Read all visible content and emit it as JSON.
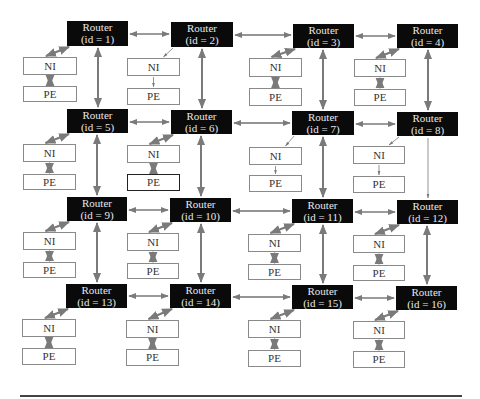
{
  "diagram": {
    "type": "2D mesh Network-on-Chip (4x4)",
    "router_label": "Router",
    "ni_label": "NI",
    "pe_label": "PE",
    "routers": [
      {
        "id": 1,
        "label": "Router",
        "sub": "(id = 1)",
        "x": 67,
        "y": 21,
        "w": 61,
        "h": 25
      },
      {
        "id": 2,
        "label": "Router",
        "sub": "(id = 2)",
        "x": 171,
        "y": 22,
        "w": 62,
        "h": 25
      },
      {
        "id": 3,
        "label": "Router",
        "sub": "(id = 3)",
        "x": 293,
        "y": 24,
        "w": 61,
        "h": 24
      },
      {
        "id": 4,
        "label": "Router",
        "sub": "(id = 4)",
        "x": 397,
        "y": 24,
        "w": 61,
        "h": 24
      },
      {
        "id": 5,
        "label": "Router",
        "sub": "(id = 5)",
        "x": 67,
        "y": 109,
        "w": 61,
        "h": 24
      },
      {
        "id": 6,
        "label": "Router",
        "sub": "(id = 6)",
        "x": 171,
        "y": 110,
        "w": 61,
        "h": 24
      },
      {
        "id": 7,
        "label": "Router",
        "sub": "(id = 7)",
        "x": 292,
        "y": 111,
        "w": 62,
        "h": 24
      },
      {
        "id": 8,
        "label": "Router",
        "sub": "(id = 8)",
        "x": 397,
        "y": 112,
        "w": 61,
        "h": 24
      },
      {
        "id": 9,
        "label": "Router",
        "sub": "(id = 9)",
        "x": 67,
        "y": 197,
        "w": 60,
        "h": 24
      },
      {
        "id": 10,
        "label": "Router",
        "sub": "(id = 10)",
        "x": 170,
        "y": 198,
        "w": 61,
        "h": 24
      },
      {
        "id": 11,
        "label": "Router",
        "sub": "(id = 11)",
        "x": 292,
        "y": 199,
        "w": 61,
        "h": 24
      },
      {
        "id": 12,
        "label": "Router",
        "sub": "(id = 12)",
        "x": 397,
        "y": 200,
        "w": 61,
        "h": 24
      },
      {
        "id": 13,
        "label": "Router",
        "sub": "(id = 13)",
        "x": 66,
        "y": 284,
        "w": 61,
        "h": 24
      },
      {
        "id": 14,
        "label": "Router",
        "sub": "(id = 14)",
        "x": 170,
        "y": 284,
        "w": 61,
        "h": 24
      },
      {
        "id": 15,
        "label": "Router",
        "sub": "(id = 15)",
        "x": 292,
        "y": 285,
        "w": 61,
        "h": 24
      },
      {
        "id": 16,
        "label": "Router",
        "sub": "(id = 16)",
        "x": 396,
        "y": 286,
        "w": 61,
        "h": 24
      }
    ],
    "nodes": [
      {
        "router": 1,
        "ni": {
          "x": 23,
          "y": 57,
          "w": 54,
          "h": 18
        },
        "pe": {
          "x": 23,
          "y": 86,
          "w": 54,
          "h": 16
        },
        "pe_bold": false,
        "thin": false
      },
      {
        "router": 2,
        "ni": {
          "x": 127,
          "y": 58,
          "w": 53,
          "h": 18
        },
        "pe": {
          "x": 127,
          "y": 88,
          "w": 53,
          "h": 17
        },
        "pe_bold": false,
        "thin": true
      },
      {
        "router": 3,
        "ni": {
          "x": 249,
          "y": 58,
          "w": 53,
          "h": 19
        },
        "pe": {
          "x": 249,
          "y": 88,
          "w": 53,
          "h": 18
        },
        "pe_bold": false,
        "thin": false
      },
      {
        "router": 4,
        "ni": {
          "x": 354,
          "y": 59,
          "w": 52,
          "h": 18
        },
        "pe": {
          "x": 354,
          "y": 89,
          "w": 52,
          "h": 17
        },
        "pe_bold": false,
        "thin": false
      },
      {
        "router": 5,
        "ni": {
          "x": 23,
          "y": 144,
          "w": 53,
          "h": 18
        },
        "pe": {
          "x": 23,
          "y": 174,
          "w": 53,
          "h": 16
        },
        "pe_bold": false,
        "thin": false
      },
      {
        "router": 6,
        "ni": {
          "x": 127,
          "y": 145,
          "w": 53,
          "h": 18
        },
        "pe": {
          "x": 127,
          "y": 174,
          "w": 53,
          "h": 17
        },
        "pe_bold": true,
        "thin": false
      },
      {
        "router": 7,
        "ni": {
          "x": 249,
          "y": 147,
          "w": 53,
          "h": 18
        },
        "pe": {
          "x": 249,
          "y": 175,
          "w": 53,
          "h": 17
        },
        "pe_bold": false,
        "thin": true
      },
      {
        "router": 8,
        "ni": {
          "x": 353,
          "y": 146,
          "w": 52,
          "h": 18
        },
        "pe": {
          "x": 353,
          "y": 176,
          "w": 52,
          "h": 17
        },
        "pe_bold": false,
        "thin": true
      },
      {
        "router": 9,
        "ni": {
          "x": 23,
          "y": 232,
          "w": 53,
          "h": 18
        },
        "pe": {
          "x": 23,
          "y": 262,
          "w": 53,
          "h": 16
        },
        "pe_bold": false,
        "thin": false
      },
      {
        "router": 10,
        "ni": {
          "x": 127,
          "y": 233,
          "w": 52,
          "h": 18
        },
        "pe": {
          "x": 127,
          "y": 263,
          "w": 52,
          "h": 16
        },
        "pe_bold": false,
        "thin": false
      },
      {
        "router": 11,
        "ni": {
          "x": 248,
          "y": 234,
          "w": 53,
          "h": 18
        },
        "pe": {
          "x": 248,
          "y": 264,
          "w": 53,
          "h": 16
        },
        "pe_bold": false,
        "thin": false
      },
      {
        "router": 12,
        "ni": {
          "x": 353,
          "y": 235,
          "w": 52,
          "h": 18
        },
        "pe": {
          "x": 353,
          "y": 265,
          "w": 52,
          "h": 16
        },
        "pe_bold": false,
        "thin": false
      },
      {
        "router": 13,
        "ni": {
          "x": 22,
          "y": 319,
          "w": 54,
          "h": 18
        },
        "pe": {
          "x": 22,
          "y": 348,
          "w": 54,
          "h": 17
        },
        "pe_bold": false,
        "thin": false
      },
      {
        "router": 14,
        "ni": {
          "x": 126,
          "y": 320,
          "w": 53,
          "h": 18
        },
        "pe": {
          "x": 126,
          "y": 349,
          "w": 53,
          "h": 17
        },
        "pe_bold": false,
        "thin": false
      },
      {
        "router": 15,
        "ni": {
          "x": 248,
          "y": 320,
          "w": 53,
          "h": 18
        },
        "pe": {
          "x": 248,
          "y": 350,
          "w": 53,
          "h": 17
        },
        "pe_bold": false,
        "thin": false
      },
      {
        "router": 16,
        "ni": {
          "x": 353,
          "y": 321,
          "w": 52,
          "h": 18
        },
        "pe": {
          "x": 353,
          "y": 351,
          "w": 52,
          "h": 17
        },
        "pe_bold": false,
        "thin": false
      }
    ],
    "links": {
      "horizontal": [
        [
          1,
          2
        ],
        [
          2,
          3
        ],
        [
          3,
          4
        ],
        [
          5,
          6
        ],
        [
          6,
          7
        ],
        [
          7,
          8
        ],
        [
          9,
          10
        ],
        [
          10,
          11
        ],
        [
          11,
          12
        ],
        [
          13,
          14
        ],
        [
          14,
          15
        ],
        [
          15,
          16
        ]
      ],
      "vertical": [
        [
          1,
          5
        ],
        [
          2,
          6
        ],
        [
          3,
          7
        ],
        [
          4,
          8
        ],
        [
          5,
          9
        ],
        [
          6,
          10
        ],
        [
          7,
          11
        ],
        [
          8,
          12
        ],
        [
          9,
          13
        ],
        [
          10,
          14
        ],
        [
          11,
          15
        ],
        [
          12,
          16
        ]
      ],
      "thin_vertical": [
        [
          8,
          12
        ]
      ],
      "one_way_right": [
        [
          2,
          3
        ],
        [
          6,
          7
        ],
        [
          10,
          11
        ],
        [
          14,
          15
        ]
      ]
    },
    "colors": {
      "router_fill": "#0a0a0a",
      "router_text": "#e8e8e8",
      "arrow": "#7a7a7a",
      "box_border": "#8a8a8a",
      "baseline": "#444444"
    }
  }
}
